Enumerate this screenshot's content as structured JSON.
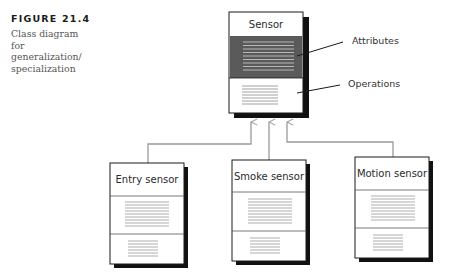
{
  "caption": {
    "figure_number": "FIGURE 21.4",
    "text": "Class diagram for generalization/ specialization",
    "lines": [
      "Class diagram",
      "for",
      "generalization/",
      "specialization"
    ]
  },
  "superclass": {
    "name": "Sensor",
    "attributes_highlighted": true,
    "highlight_color": "#5a5a5a"
  },
  "annotations": {
    "attributes": "Attributes",
    "operations": "Operations"
  },
  "subclasses": [
    {
      "name": "Entry sensor"
    },
    {
      "name": "Smoke sensor"
    },
    {
      "name": "Motion sensor"
    }
  ],
  "relationship": "generalization",
  "colors": {
    "box_border": "#1a1a1a",
    "shadow": "#111111",
    "connector": "#9a9a9a",
    "text_lines": "#8a8a8a",
    "highlight_lines": "#cfcfcf"
  }
}
